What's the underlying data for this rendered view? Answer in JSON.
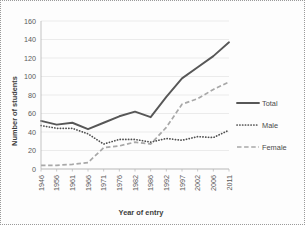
{
  "chart_data": {
    "type": "line",
    "title": "",
    "xlabel": "Year of entry",
    "ylabel": "Number of students",
    "categories": [
      "1946",
      "1956",
      "1961",
      "1966",
      "1971",
      "1976",
      "1982",
      "1986",
      "1992",
      "1997",
      "2002",
      "2006",
      "2011"
    ],
    "yticks": [
      0,
      20,
      40,
      60,
      80,
      100,
      120,
      140,
      160
    ],
    "ylim": [
      0,
      160
    ],
    "grid": true,
    "legend_position": "right",
    "series": [
      {
        "name": "Total",
        "style": "solid",
        "color": "#575757",
        "values": [
          52,
          48,
          50,
          43,
          50,
          57,
          62,
          56,
          78,
          98,
          110,
          122,
          137
        ]
      },
      {
        "name": "Male",
        "style": "dotted",
        "color": "#4f4f4f",
        "values": [
          47,
          44,
          44,
          38,
          27,
          32,
          32,
          29,
          33,
          31,
          35,
          34,
          42
        ]
      },
      {
        "name": "Female",
        "style": "dashed",
        "color": "#a8a8a8",
        "values": [
          4,
          4,
          5,
          7,
          23,
          25,
          29,
          27,
          45,
          70,
          76,
          86,
          94
        ]
      }
    ]
  },
  "legend": {
    "entries": [
      {
        "label": "Total"
      },
      {
        "label": "Male"
      },
      {
        "label": "Female"
      }
    ]
  }
}
